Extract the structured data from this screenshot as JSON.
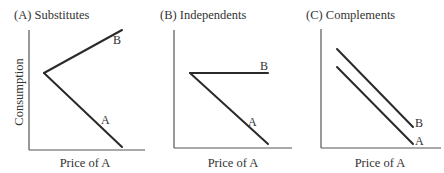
{
  "figure": {
    "y_axis_label": "Consumption",
    "panels": [
      {
        "id": "A",
        "title": "(A) Substitutes",
        "xlabel": "Price of A",
        "curves": [
          {
            "label": "B",
            "description": "Consumption of B rises as price of A rises"
          },
          {
            "label": "A",
            "description": "Consumption of A falls as price of A rises"
          }
        ]
      },
      {
        "id": "B",
        "title": "(B) Independents",
        "xlabel": "Price of A",
        "curves": [
          {
            "label": "B",
            "description": "Consumption of B unchanged as price of A rises"
          },
          {
            "label": "A",
            "description": "Consumption of A falls as price of A rises"
          }
        ]
      },
      {
        "id": "C",
        "title": "(C) Complements",
        "xlabel": "Price of A",
        "curves": [
          {
            "label": "B",
            "description": "Consumption of B falls as price of A rises"
          },
          {
            "label": "A",
            "description": "Consumption of A falls as price of A rises"
          }
        ]
      }
    ]
  }
}
